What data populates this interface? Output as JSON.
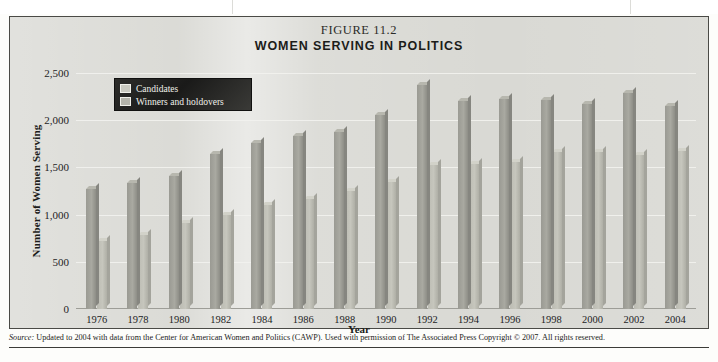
{
  "figure": {
    "number": "FIGURE 11.2",
    "title": "WOMEN SERVING IN POLITICS",
    "source_prefix": "Source:",
    "source_text": " Updated to 2004 with data from the Center for American Women and Politics (CAWP). Used with permission of The Associated Press Copyright © 2007. All rights reserved."
  },
  "legend": {
    "items": [
      {
        "label": "Candidates",
        "color": "#a9a9a1"
      },
      {
        "label": "Winners and holdovers",
        "color": "#c6c6bd"
      }
    ]
  },
  "axes": {
    "y_label": "Number of Women Serving",
    "x_label": "Year",
    "y_ticks": [
      "0",
      "500",
      "1,000",
      "1,500",
      "2,000",
      "2,500"
    ]
  },
  "chart_data": {
    "type": "bar",
    "title": "WOMEN SERVING IN POLITICS",
    "subtitle": "FIGURE 11.2",
    "xlabel": "Year",
    "ylabel": "Number of Women Serving",
    "ylim": [
      0,
      2500
    ],
    "yticks": [
      0,
      500,
      1000,
      1500,
      2000,
      2500
    ],
    "grid": true,
    "legend_position": "top-left",
    "categories": [
      "1976",
      "1978",
      "1980",
      "1982",
      "1984",
      "1986",
      "1988",
      "1990",
      "1992",
      "1994",
      "1996",
      "1998",
      "2000",
      "2002",
      "2004"
    ],
    "series": [
      {
        "name": "Candidates",
        "color": "#a9a9a1",
        "values": [
          1270,
          1340,
          1410,
          1640,
          1760,
          1830,
          1880,
          2060,
          2370,
          2200,
          2220,
          2210,
          2170,
          2290,
          2150
        ]
      },
      {
        "name": "Winners and holdovers",
        "color": "#c6c6bd",
        "values": [
          720,
          780,
          910,
          1000,
          1100,
          1170,
          1250,
          1350,
          1530,
          1540,
          1560,
          1660,
          1660,
          1630,
          1670
        ]
      }
    ]
  }
}
